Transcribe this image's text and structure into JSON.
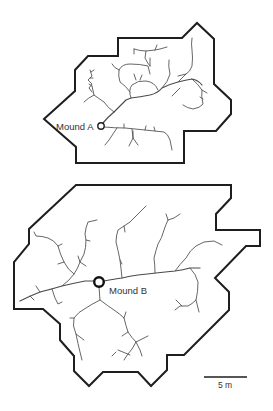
{
  "figure": {
    "plot_a": {
      "label": "Mound A",
      "outline_points": "118,38 182,38 197,23 214,39 214,84 231,100 231,114 216,131 184,131 184,163 76,163 76,147 44,119 75,91 75,70 88,56 118,56",
      "mound": {
        "cx": 101,
        "cy": 126,
        "r": 3.2
      }
    },
    "plot_b": {
      "label": "Mound B",
      "outline_points": "76,185 231,185 231,198 216,214 216,230 260,230 260,246 246,246 215,278 229,292 229,310 184,355 167,355 167,370 151,386 138,372 103,372 89,386 74,371 74,356 60,340 60,324 43,309 14,309 14,262 29,244 29,229",
      "mound": {
        "cx": 99,
        "cy": 282,
        "r": 4.8
      }
    },
    "scale_bar": {
      "label": "5 m",
      "x1": 204,
      "x2": 247,
      "y": 377
    },
    "colors": {
      "outline": "#1e1e1e",
      "channels": "#555555",
      "background": "#ffffff"
    }
  }
}
